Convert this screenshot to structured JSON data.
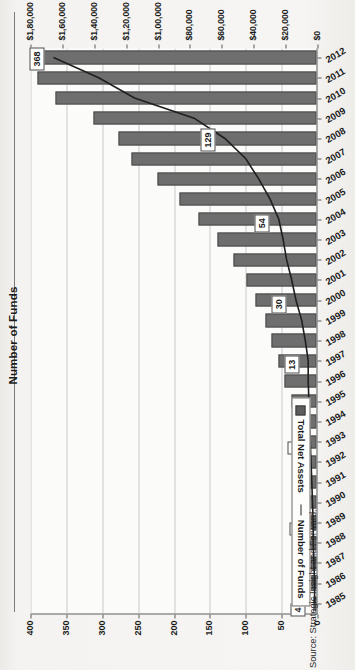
{
  "chart_data": {
    "type": "bar",
    "title": "Number of Funds",
    "orientation": "horizontal",
    "categories": [
      "1985",
      "1986",
      "1987",
      "1988",
      "1989",
      "1990",
      "1991",
      "1992",
      "1993",
      "1994",
      "1995",
      "1996",
      "1997",
      "1998",
      "1999",
      "2000",
      "2001",
      "2002",
      "2003",
      "2004",
      "2005",
      "2006",
      "2007",
      "2008",
      "2009",
      "2010",
      "2011",
      "2012"
    ],
    "xlabel": "Number of Funds",
    "ylabel": "Total Net Assets ($Mn.)",
    "xlim": [
      0,
      400
    ],
    "xticks": [
      "0",
      "50",
      "100",
      "150",
      "200",
      "250",
      "300",
      "350",
      "400"
    ],
    "ylim": [
      0,
      180000
    ],
    "yticks": [
      "$0",
      "$20,000",
      "$40,000",
      "$60,000",
      "$80,000",
      "$1,00,000",
      "$1,20,000",
      "$1,40,000",
      "$1,60,000",
      "$1,80,000"
    ],
    "grid": true,
    "legend_position": "bottom-left",
    "series": [
      {
        "name": "Total Net Assets",
        "type": "bar",
        "axis": "Total Net Assets ($Mn.)",
        "values": [
          2000,
          3000,
          4000,
          4500,
          5500,
          6500,
          7500,
          9000,
          11000,
          13500,
          16000,
          20000,
          24000,
          28000,
          32000,
          38000,
          44000,
          52000,
          62000,
          74000,
          86000,
          100000,
          116000,
          124000,
          140000,
          164000,
          175000,
          180000
        ]
      },
      {
        "name": "Number of Funds",
        "type": "line",
        "axis": "Number of Funds",
        "values": [
          4,
          4,
          5,
          6,
          6,
          7,
          8,
          9,
          10,
          11,
          12,
          13,
          13,
          17,
          22,
          30,
          36,
          43,
          48,
          54,
          66,
          82,
          100,
          129,
          172,
          255,
          305,
          368
        ]
      }
    ],
    "data_labels": [
      {
        "category": "1985",
        "value": 4
      },
      {
        "category": "1989",
        "value": 6
      },
      {
        "category": "1993",
        "value": 9
      },
      {
        "category": "1997",
        "value": 13
      },
      {
        "category": "2000",
        "value": 30
      },
      {
        "category": "2004",
        "value": 54
      },
      {
        "category": "2008",
        "value": 129
      },
      {
        "category": "2012",
        "value": 368
      }
    ]
  },
  "legend": {
    "bar_label": "Total Net Assets",
    "line_label": "Number of Funds"
  },
  "source": {
    "text": "Source: Strategic Insight and Forward."
  },
  "colors": {
    "bar": "#6e6e6e",
    "line": "#1f1f1f",
    "grid": "#c9c9c9",
    "axis": "#5a5a5a",
    "plot_bg": "#fbfbfa",
    "page_bg": "#f3f2f0"
  }
}
